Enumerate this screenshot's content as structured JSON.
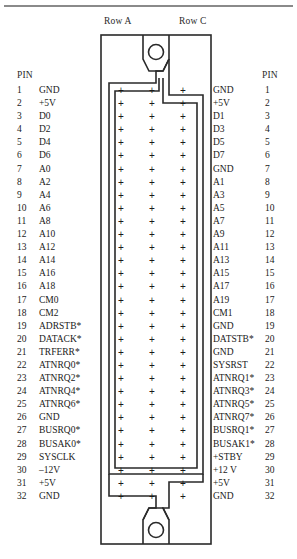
{
  "diagram": {
    "row_headers": {
      "row_a": "Row A",
      "row_c": "Row C"
    },
    "pin_heading_left": "PIN",
    "pin_heading_right": "PIN",
    "contact_columns": [
      "A",
      "B",
      "C"
    ],
    "contact_marker": "+",
    "colors": {
      "line": "#2a2a2a",
      "rule": "#8a8a8a",
      "text": "#1a1a1a",
      "background": "#ffffff"
    }
  },
  "left_column": [
    {
      "pin": "1",
      "signal": "GND"
    },
    {
      "pin": "2",
      "signal": "+5V"
    },
    {
      "pin": "3",
      "signal": "D0"
    },
    {
      "pin": "4",
      "signal": "D2"
    },
    {
      "pin": "5",
      "signal": "D4"
    },
    {
      "pin": "6",
      "signal": "D6"
    },
    {
      "pin": "7",
      "signal": "A0"
    },
    {
      "pin": "8",
      "signal": "A2"
    },
    {
      "pin": "9",
      "signal": "A4"
    },
    {
      "pin": "10",
      "signal": "A6"
    },
    {
      "pin": "11",
      "signal": "A8"
    },
    {
      "pin": "12",
      "signal": "A10"
    },
    {
      "pin": "13",
      "signal": "A12"
    },
    {
      "pin": "14",
      "signal": "A14"
    },
    {
      "pin": "15",
      "signal": "A16"
    },
    {
      "pin": "16",
      "signal": "A18"
    },
    {
      "pin": "17",
      "signal": "CM0"
    },
    {
      "pin": "18",
      "signal": "CM2"
    },
    {
      "pin": "19",
      "signal": "ADRSTB*"
    },
    {
      "pin": "20",
      "signal": "DATACK*"
    },
    {
      "pin": "21",
      "signal": "TRFERR*"
    },
    {
      "pin": "22",
      "signal": "ATNRQ0*"
    },
    {
      "pin": "23",
      "signal": "ATNRQ2*"
    },
    {
      "pin": "24",
      "signal": "ATNRQ4*"
    },
    {
      "pin": "25",
      "signal": "ATNRQ6*"
    },
    {
      "pin": "26",
      "signal": "GND"
    },
    {
      "pin": "27",
      "signal": "BUSRQ0*"
    },
    {
      "pin": "28",
      "signal": "BUSAK0*"
    },
    {
      "pin": "29",
      "signal": "SYSCLK"
    },
    {
      "pin": "30",
      "signal": "–12V"
    },
    {
      "pin": "31",
      "signal": "+5V"
    },
    {
      "pin": "32",
      "signal": "GND"
    }
  ],
  "right_column": [
    {
      "signal": "GND",
      "pin": "1"
    },
    {
      "signal": "+5V",
      "pin": "2"
    },
    {
      "signal": "D1",
      "pin": "3"
    },
    {
      "signal": "D3",
      "pin": "4"
    },
    {
      "signal": "D5",
      "pin": "5"
    },
    {
      "signal": "D7",
      "pin": "6"
    },
    {
      "signal": "GND",
      "pin": "7"
    },
    {
      "signal": "A1",
      "pin": "8"
    },
    {
      "signal": "A3",
      "pin": "9"
    },
    {
      "signal": "A5",
      "pin": "10"
    },
    {
      "signal": "A7",
      "pin": "11"
    },
    {
      "signal": "A9",
      "pin": "12"
    },
    {
      "signal": "A11",
      "pin": "13"
    },
    {
      "signal": "A13",
      "pin": "14"
    },
    {
      "signal": "A15",
      "pin": "15"
    },
    {
      "signal": "A17",
      "pin": "16"
    },
    {
      "signal": "A19",
      "pin": "17"
    },
    {
      "signal": "CM1",
      "pin": "18"
    },
    {
      "signal": "GND",
      "pin": "19"
    },
    {
      "signal": "DATSTB*",
      "pin": "20"
    },
    {
      "signal": "GND",
      "pin": "21"
    },
    {
      "signal": "SYSRST",
      "pin": "22"
    },
    {
      "signal": "ATNRQ1*",
      "pin": "23"
    },
    {
      "signal": "ATNRQ3*",
      "pin": "24"
    },
    {
      "signal": "ATNRQ5*",
      "pin": "25"
    },
    {
      "signal": "ATNRQ7*",
      "pin": "26"
    },
    {
      "signal": "BUSRQ1*",
      "pin": "27"
    },
    {
      "signal": "BUSAK1*",
      "pin": "28"
    },
    {
      "signal": "+STBY",
      "pin": "29"
    },
    {
      "signal": "+12 V",
      "pin": "30"
    },
    {
      "signal": "+5V",
      "pin": "31"
    },
    {
      "signal": "GND",
      "pin": "32"
    }
  ]
}
